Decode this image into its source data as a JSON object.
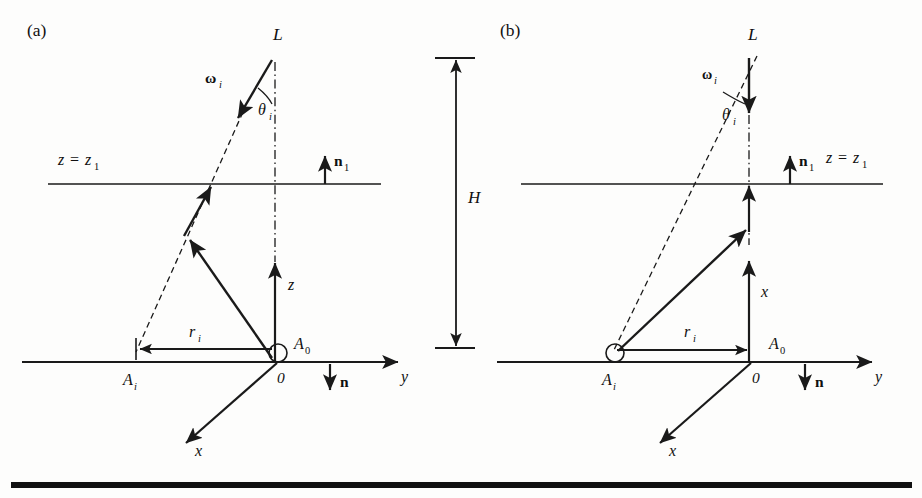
{
  "figure": {
    "background_color": "#fdfdfc",
    "ink_color": "#1a1a1a",
    "rule_color": "#111111"
  },
  "panels": [
    {
      "id": "panel-a",
      "label": "(a)",
      "source_label": "L",
      "incident_direction_label": "ω",
      "incident_direction_sub": "i",
      "angle_label": "θ",
      "angle_sub": "i",
      "plane_label_lhs": "z",
      "plane_label_eq": "=",
      "plane_label_rhs": "z",
      "plane_label_sub": "1",
      "plane_normal_label": "n",
      "plane_normal_sub": "1",
      "vertical_axis_label": "z",
      "radial_label": "r",
      "radial_sub": "i",
      "origin_label": "0",
      "origin_point_label": "A",
      "origin_point_sub": "0",
      "image_point_label": "A",
      "image_point_sub": "i",
      "depth_axis_label": "x",
      "horizontal_axis_label": "y",
      "surface_normal_label": "n"
    },
    {
      "id": "panel-b",
      "label": "(b)",
      "source_label": "L",
      "incident_direction_label": "ω",
      "incident_direction_sub": "i",
      "angle_label": "θ",
      "angle_sub": "i",
      "plane_label_lhs": "z",
      "plane_label_eq": "=",
      "plane_label_rhs": "z",
      "plane_label_sub": "1",
      "plane_normal_label": "n",
      "plane_normal_sub": "1",
      "vertical_axis_label": "x",
      "radial_label": "r",
      "radial_sub": "i",
      "origin_label": "0",
      "origin_point_label": "A",
      "origin_point_sub": "0",
      "image_point_label": "A",
      "image_point_sub": "i",
      "depth_axis_label": "x",
      "horizontal_axis_label": "y",
      "surface_normal_label": "n"
    }
  ],
  "height_dimension": {
    "label": "H"
  }
}
